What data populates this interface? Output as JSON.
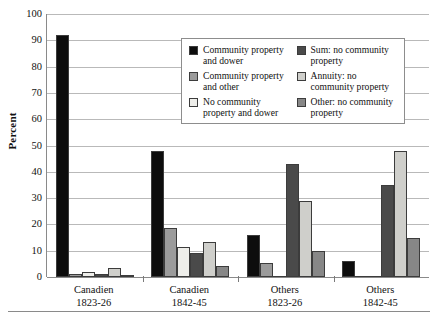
{
  "chart_data": {
    "type": "bar",
    "title": "",
    "xlabel": "",
    "ylabel": "Percent",
    "ylim": [
      0,
      100
    ],
    "yticks": [
      0,
      10,
      20,
      30,
      40,
      50,
      60,
      70,
      80,
      90,
      100
    ],
    "grid": true,
    "legend_position": "upper-center",
    "categories": [
      "Canadien 1823-26",
      "Canadien 1842-45",
      "Others 1823-26",
      "Others 1842-45"
    ],
    "category_lines": [
      [
        "Canadien",
        "1823-26"
      ],
      [
        "Canadien",
        "1842-45"
      ],
      [
        "Others",
        "1823-26"
      ],
      [
        "Others",
        "1842-45"
      ]
    ],
    "series": [
      {
        "name": "Community property and dower",
        "color": "#0d0d0d",
        "values": [
          92,
          48,
          16,
          6
        ]
      },
      {
        "name": "Community property and other",
        "color": "#9b9b9b",
        "values": [
          1,
          18.5,
          5.5,
          0
        ]
      },
      {
        "name": "No community property and dower",
        "color": "#eeeeea",
        "values": [
          2,
          11.5,
          0,
          0
        ]
      },
      {
        "name": "Sum: no community property",
        "color": "#4a4a4a",
        "values": [
          1,
          9,
          43,
          35
        ]
      },
      {
        "name": "Annuity: no community property",
        "color": "#cfcfcb",
        "values": [
          3.5,
          13.5,
          29,
          48
        ]
      },
      {
        "name": "Other: no community property",
        "color": "#878787",
        "values": [
          0.5,
          4,
          10,
          15
        ]
      }
    ],
    "legend_entries": [
      {
        "label_lines": [
          "Community property",
          "and dower"
        ],
        "color": "#0d0d0d"
      },
      {
        "label_lines": [
          "Community property",
          "and other"
        ],
        "color": "#9b9b9b"
      },
      {
        "label_lines": [
          "No community",
          "property and dower"
        ],
        "color": "#eeeeea"
      },
      {
        "label_lines": [
          "Sum: no community",
          "property"
        ],
        "color": "#4a4a4a"
      },
      {
        "label_lines": [
          "Annuity: no",
          "community property"
        ],
        "color": "#cfcfcb"
      },
      {
        "label_lines": [
          "Other: no community",
          "property"
        ],
        "color": "#878787"
      }
    ]
  }
}
